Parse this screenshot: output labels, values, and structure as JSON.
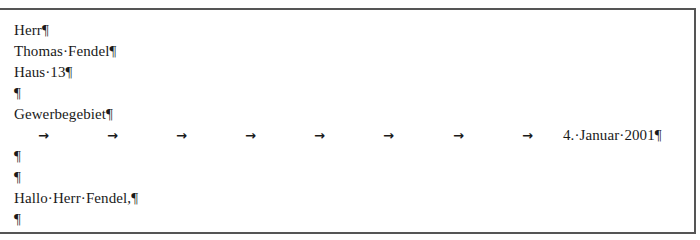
{
  "document": {
    "lines": [
      "Herr¶",
      "Thomas·Fendel¶",
      "Haus·13¶",
      "¶",
      "Gewerbegebiet¶"
    ],
    "tab_line": {
      "arrow_glyph": "→",
      "arrow_count": 8,
      "date_text": "4.·Januar·2001¶"
    },
    "lines_after": [
      "¶",
      "¶",
      "Hallo·Herr·Fendel,¶",
      "¶"
    ]
  }
}
